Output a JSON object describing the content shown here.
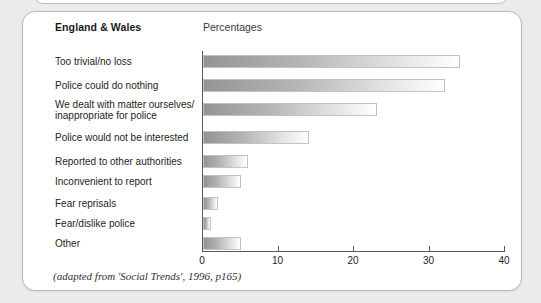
{
  "page": {
    "background_color": "#eceaea",
    "card_background": "#ffffff"
  },
  "header": {
    "region_title": "England & Wales",
    "units_label": "Percentages"
  },
  "source_note": "(adapted from 'Social Trends', 1996, p165)",
  "chart_data": {
    "type": "bar",
    "orientation": "horizontal",
    "title": "England & Wales",
    "subtitle": "Percentages",
    "xlabel": "",
    "ylabel": "",
    "xlim": [
      0,
      40
    ],
    "xticks": [
      0,
      10,
      20,
      30,
      40
    ],
    "xtick_labels": [
      "0",
      "10",
      "20",
      "30",
      "40"
    ],
    "grid": false,
    "legend": false,
    "bar_color_start": "#949494",
    "bar_color_end": "#ffffff",
    "bar_border_color": "#c3c3c3",
    "categories": [
      "Too trivial/no loss",
      "Police could do nothing",
      "We dealt with matter ourselves/\ninappropriate for police",
      "Police would not be interested",
      "Reported to other authorities",
      "Inconvenient to report",
      "Fear reprisals",
      "Fear/dislike police",
      "Other"
    ],
    "values": [
      34,
      32,
      23,
      14,
      6,
      5,
      2,
      1,
      5
    ],
    "annotation": "(adapted from 'Social Trends', 1996, p165)"
  }
}
